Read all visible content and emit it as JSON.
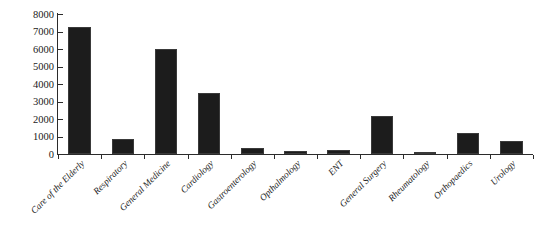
{
  "chart_data": {
    "type": "bar",
    "title": "",
    "subtitle": "",
    "xlabel": "",
    "ylabel": "",
    "categories": [
      "Care of the Elderly",
      "Respiratory",
      "General Medicine",
      "Cardiology",
      "Gastroenterology",
      "Opthalmology",
      "ENT",
      "General Surgery",
      "Rheumatology",
      "Orthopaedics",
      "Urology"
    ],
    "values": [
      7250,
      850,
      6000,
      3500,
      320,
      150,
      220,
      2180,
      100,
      1220,
      730
    ],
    "ylim": [
      0,
      8000
    ],
    "ytick_values": [
      0,
      1000,
      2000,
      3000,
      4000,
      5000,
      6000,
      7000,
      8000
    ],
    "ytick_labels": [
      "0",
      "1000",
      "2000",
      "3000",
      "4000",
      "5000",
      "6000",
      "7000",
      "8000"
    ],
    "grid": false,
    "legend": false,
    "legend_position": "none",
    "bar_color": "#1c1c1c",
    "axis_color": "#2b2b2b",
    "background_color": "#ffffff",
    "xtick_label_rotation": -45
  }
}
